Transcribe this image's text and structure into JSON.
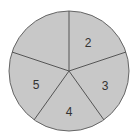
{
  "diagram": {
    "type": "spinner",
    "sectors": [
      {
        "label": "2",
        "position": "top-right"
      },
      {
        "label": "3",
        "position": "bottom-right"
      },
      {
        "label": "4",
        "position": "bottom"
      },
      {
        "label": "5",
        "position": "bottom-left"
      },
      {
        "label": "",
        "position": "top-left"
      }
    ],
    "colors": {
      "fill": "#c8c8c8",
      "stroke": "#555555",
      "text": "#333333"
    }
  }
}
